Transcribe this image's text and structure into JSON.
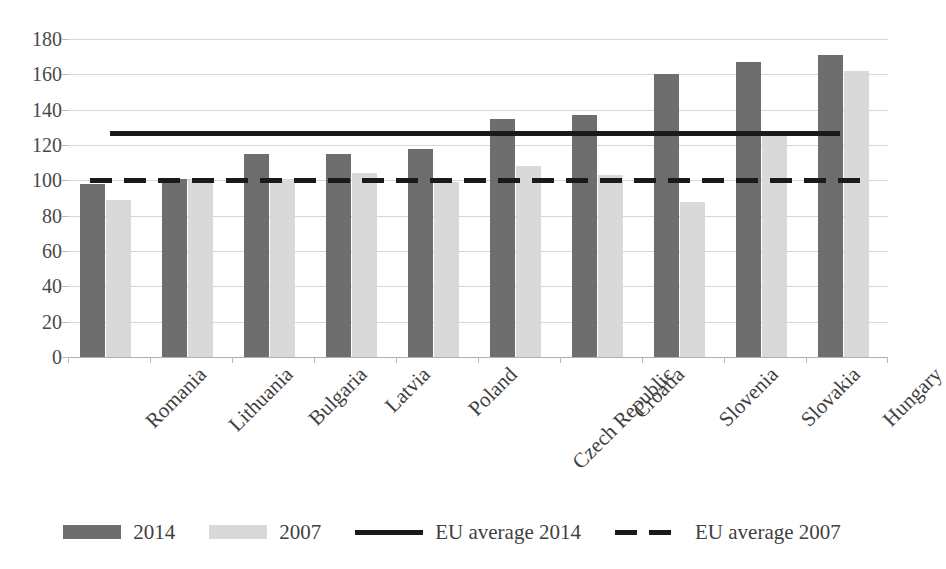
{
  "chart_data": {
    "type": "bar",
    "title": "",
    "subtitle": "",
    "xlabel": "",
    "ylabel": "",
    "ylim": [
      0,
      180
    ],
    "yticks": [
      0,
      20,
      40,
      60,
      80,
      100,
      120,
      140,
      160,
      180
    ],
    "grid": true,
    "legend_position": "bottom",
    "categories": [
      "Romania",
      "Lithuania",
      "Bulgaria",
      "Latvia",
      "Poland",
      "Czech Republic",
      "Croatia",
      "Slovenia",
      "Slovakia",
      "Hungary"
    ],
    "series": [
      {
        "name": "2014",
        "color": "#6e6e6e",
        "values": [
          98,
          101,
          115,
          115,
          118,
          135,
          137,
          160,
          167,
          171
        ]
      },
      {
        "name": "2007",
        "color": "#d9d9d9",
        "values": [
          89,
          101,
          101,
          104,
          99,
          108,
          103,
          88,
          126,
          162
        ]
      }
    ],
    "reference_lines": [
      {
        "name": "EU average 2014",
        "value": 127,
        "style": "solid",
        "color": "#1a1a1a"
      },
      {
        "name": "EU average 2007",
        "value": 100,
        "style": "dashed",
        "color": "#1a1a1a"
      }
    ]
  },
  "legend": {
    "items": [
      {
        "label": "2014",
        "swatch": "bar-dark"
      },
      {
        "label": "2007",
        "swatch": "bar-light"
      },
      {
        "label": "EU average 2014",
        "swatch": "line-solid"
      },
      {
        "label": "EU average 2007",
        "swatch": "line-dashed"
      }
    ]
  }
}
